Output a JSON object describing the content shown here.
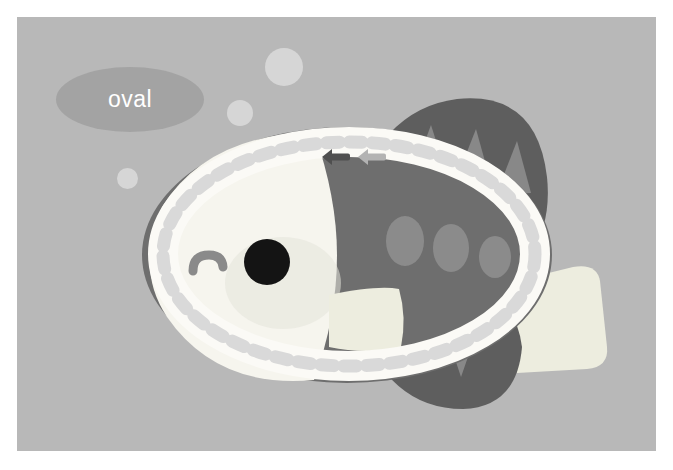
{
  "canvas": {
    "width": 639,
    "height": 434,
    "background_color": "#b8b8b8",
    "page_margin_color": "#ffffff"
  },
  "selection": {
    "shape_type": "oval",
    "label_text": "oval",
    "label_background_color": "#969696",
    "label_text_color": "#ffffff",
    "ring_band_color": "#fbfaf6",
    "ring_dash_color": "#d9d9d9",
    "ring_dash_count": 46,
    "bounds": {
      "x": 126,
      "y": 105,
      "width": 412,
      "height": 265
    }
  },
  "handles": [
    {
      "name": "resize-handle-active",
      "icon": "arrow-left-icon",
      "color": "#4f4f4f",
      "state": "active",
      "x": 304,
      "y": 130
    },
    {
      "name": "resize-handle-ghost",
      "icon": "arrow-left-icon",
      "color": "#b3b3b3",
      "state": "ghost",
      "x": 340,
      "y": 130
    }
  ],
  "artwork": {
    "subject": "fish",
    "body_color": "#6e6e6e",
    "head_color": "#f6f5ee",
    "fin_color": "#ededdf",
    "fin_dark_color": "#5e5e5e",
    "fin_notch_color": "#888888",
    "spot_color": "#8b8b8b",
    "eye_color": "#141414",
    "mouth_color": "#8a8a8a",
    "spots": [
      {
        "cx": 388,
        "cy": 224,
        "rx": 19,
        "ry": 25
      },
      {
        "cx": 434,
        "cy": 231,
        "rx": 18,
        "ry": 24
      },
      {
        "cx": 478,
        "cy": 240,
        "rx": 16,
        "ry": 21
      }
    ],
    "eye": {
      "cx": 250,
      "cy": 245,
      "r": 23
    },
    "bubbles": [
      {
        "name": "bubble-large",
        "cx": 267,
        "cy": 50,
        "r": 19
      },
      {
        "name": "bubble-medium",
        "cx": 223,
        "cy": 96,
        "r": 13
      },
      {
        "name": "bubble-small",
        "cx": 110,
        "cy": 161,
        "r": 10
      }
    ],
    "bubble_color": "#d6d6d6"
  }
}
